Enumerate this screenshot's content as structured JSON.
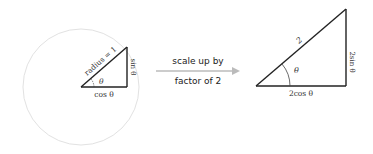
{
  "left_figure": {
    "hypotenuse_label": "radius = 1",
    "angle_label": "θ",
    "adjacent_label": "cos θ",
    "opposite_label": "sin θ",
    "circle_color": "#e2e2e2"
  },
  "arrow": {
    "line1": "scale up by",
    "line2": "factor of 2",
    "color": "#bbbbbb"
  },
  "right_figure": {
    "hypotenuse_label": "2",
    "angle_label": "θ",
    "adjacent_label": "2cos θ",
    "opposite_label": "2sin θ"
  }
}
